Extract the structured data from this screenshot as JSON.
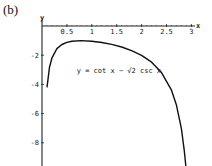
{
  "panel_label": "(b)",
  "chart_data": {
    "type": "line",
    "title": "",
    "xlabel": "x",
    "ylabel": "y",
    "xlim": [
      0,
      3.1
    ],
    "ylim": [
      -9.3,
      0.4
    ],
    "grid": false,
    "legend": null,
    "x_ticks": [
      0.5,
      1,
      1.5,
      2,
      2.5,
      3
    ],
    "x_tick_labels": [
      "0.5",
      "1",
      "1.5",
      "2",
      "2.5",
      "3"
    ],
    "y_ticks": [
      -2,
      -4,
      -6,
      -8
    ],
    "y_tick_labels": [
      "-2",
      "-4",
      "-6",
      "-8"
    ],
    "annotations": [
      {
        "text": "y = cot x − √2 csc x",
        "x": 1.1,
        "y": -3.1
      }
    ],
    "series": [
      {
        "name": "y = cot x − √2 csc x",
        "x": [
          0.1,
          0.15,
          0.2,
          0.3,
          0.4,
          0.5,
          0.6,
          0.785,
          1.0,
          1.2,
          1.4,
          1.6,
          1.8,
          2.0,
          2.2,
          2.4,
          2.6,
          2.7,
          2.8,
          2.86,
          2.9
        ],
        "y": [
          -4.2,
          -2.82,
          -2.18,
          -1.55,
          -1.27,
          -1.12,
          -1.04,
          -1.0,
          -1.04,
          -1.13,
          -1.26,
          -1.44,
          -1.69,
          -2.01,
          -2.48,
          -3.19,
          -4.4,
          -5.43,
          -7.03,
          -8.61,
          -9.98
        ]
      }
    ]
  },
  "colors": {
    "curve": "#111111",
    "axis": "#222222",
    "background": "#ffffff"
  }
}
